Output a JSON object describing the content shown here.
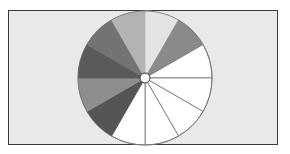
{
  "figure": {
    "background": "#e9e9e9",
    "border_color": "#3a3a3a",
    "pie": {
      "center": [
        145,
        78
      ],
      "radius": 67,
      "hub_radius": 5,
      "stroke": "#6e6e6e",
      "wedges": [
        {
          "start": 0,
          "end": 30,
          "color": "#e4e4e4"
        },
        {
          "start": 30,
          "end": 60,
          "color": "#8a8a8a"
        },
        {
          "start": 60,
          "end": 90,
          "color": "#ffffff"
        },
        {
          "start": 90,
          "end": 120,
          "color": "#ffffff"
        },
        {
          "start": 120,
          "end": 150,
          "color": "#ffffff"
        },
        {
          "start": 150,
          "end": 180,
          "color": "#ffffff"
        },
        {
          "start": 180,
          "end": 210,
          "color": "#ffffff"
        },
        {
          "start": 210,
          "end": 240,
          "color": "#555555"
        },
        {
          "start": 240,
          "end": 270,
          "color": "#8e8e8e"
        },
        {
          "start": 270,
          "end": 300,
          "color": "#5a5a5a"
        },
        {
          "start": 300,
          "end": 330,
          "color": "#737373"
        },
        {
          "start": 330,
          "end": 360,
          "color": "#b3b3b3"
        }
      ]
    }
  }
}
